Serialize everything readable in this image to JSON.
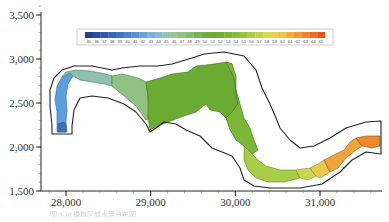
{
  "chart_data": {
    "type": "heatmap",
    "subtype": "contour-map-polygons",
    "title": "",
    "xlabel": "",
    "ylabel": "",
    "xlim": [
      27700,
      31700
    ],
    "ylim": [
      1500,
      3600
    ],
    "x_ticks": [
      {
        "value": 28000,
        "label": "28,000"
      },
      {
        "value": 29000,
        "label": "29,000"
      },
      {
        "value": 30000,
        "label": "30,000"
      },
      {
        "value": 31000,
        "label": "31,000"
      }
    ],
    "y_ticks": [
      {
        "value": 1500,
        "label": "1,500"
      },
      {
        "value": 2000,
        "label": "2,000"
      },
      {
        "value": 2500,
        "label": "2,500"
      },
      {
        "value": 3000,
        "label": "3,000"
      },
      {
        "value": 3500,
        "label": "3,500"
      }
    ],
    "grid": false,
    "legend": {
      "position": "top-center",
      "type": "colorbar",
      "min": 35,
      "max": 65,
      "labels": [
        "35",
        "36",
        "37",
        "38",
        "39",
        "40",
        "41",
        "42",
        "43",
        "44",
        "45",
        "46",
        "47",
        "48",
        "49",
        "50",
        "51",
        "52",
        "53",
        "54",
        "55",
        "56",
        "57",
        "58",
        "59",
        "60",
        "61",
        "62",
        "63",
        "64",
        "65"
      ],
      "colors": [
        "#2a3f8f",
        "#2f4b9b",
        "#3557a8",
        "#3b63b3",
        "#4570bf",
        "#4f7fca",
        "#5a8ed3",
        "#6a9fd8",
        "#7db0d5",
        "#8cbcc9",
        "#96c2b6",
        "#98c49e",
        "#8fc185",
        "#84bc6c",
        "#78b455",
        "#6fad41",
        "#6aab34",
        "#70b034",
        "#7bb636",
        "#89bd3a",
        "#98c53f",
        "#a8cc45",
        "#bcd34c",
        "#d2da52",
        "#e3d353",
        "#ecc248",
        "#efae3e",
        "#f09a35",
        "#ef852d",
        "#ec6e25",
        "#e8561e"
      ]
    },
    "regions": [
      {
        "name": "upstream-west-bend",
        "value_range": [
          37,
          42
        ],
        "color": "#5a9fe0"
      },
      {
        "name": "west-bend-top",
        "value_range": [
          42,
          46
        ],
        "color": "#8fbfae"
      },
      {
        "name": "main-green-body",
        "value_range": [
          48,
          52
        ],
        "color": "#6aab34"
      },
      {
        "name": "central-channel",
        "value_range": [
          50,
          54
        ],
        "color": "#80b83c"
      },
      {
        "name": "south-bend",
        "value_range": [
          54,
          58
        ],
        "color": "#bcd84e"
      },
      {
        "name": "east-reach",
        "value_range": [
          59,
          63
        ],
        "color": "#f0a33a"
      },
      {
        "name": "east-outlet",
        "value_range": [
          63,
          65
        ],
        "color": "#ef8a2c"
      }
    ]
  },
  "caption": {
    "text": "图 3-10 模拟区域水温分布图"
  }
}
